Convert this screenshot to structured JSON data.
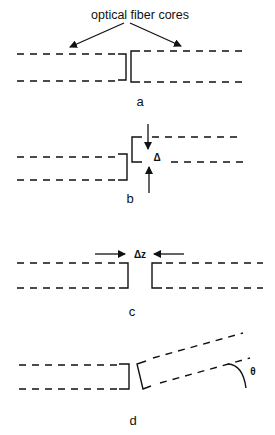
{
  "figure": {
    "callout": "optical fiber cores",
    "panels": [
      {
        "id": "a",
        "label": "a",
        "description": "fibers aligned end to end"
      },
      {
        "id": "b",
        "label": "b",
        "description": "lateral offset",
        "symbol": "Δ"
      },
      {
        "id": "c",
        "label": "c",
        "description": "longitudinal gap",
        "symbol": "Δz"
      },
      {
        "id": "d",
        "label": "d",
        "description": "angular misalignment",
        "symbol": "θ"
      }
    ]
  },
  "colors": {
    "ink": "#111111",
    "background": "#ffffff"
  }
}
